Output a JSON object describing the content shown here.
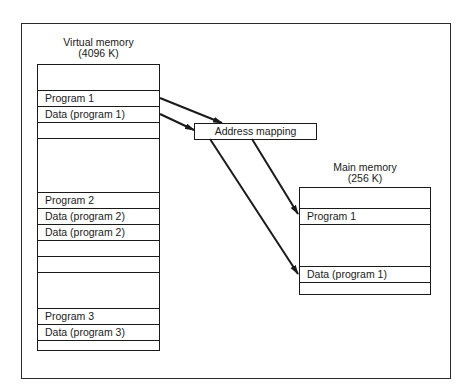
{
  "diagram": {
    "virtual_memory": {
      "title": "Virtual memory",
      "size": "(4096 K)",
      "rows": [
        {
          "label": "",
          "top": 0,
          "height": 26
        },
        {
          "label": "Program 1",
          "top": 26,
          "height": 16
        },
        {
          "label": "Data (program 1)",
          "top": 42,
          "height": 16
        },
        {
          "label": "",
          "top": 58,
          "height": 16
        },
        {
          "label": "",
          "top": 74,
          "height": 54
        },
        {
          "label": "Program 2",
          "top": 128,
          "height": 16
        },
        {
          "label": "Data (program 2)",
          "top": 144,
          "height": 16
        },
        {
          "label": "Data (program 2)",
          "top": 160,
          "height": 16
        },
        {
          "label": "",
          "top": 176,
          "height": 16
        },
        {
          "label": "",
          "top": 192,
          "height": 16
        },
        {
          "label": "",
          "top": 208,
          "height": 36
        },
        {
          "label": "Program 3",
          "top": 244,
          "height": 16
        },
        {
          "label": "Data (program 3)",
          "top": 260,
          "height": 16
        },
        {
          "label": "",
          "top": 276,
          "height": 11
        }
      ]
    },
    "address_mapping": {
      "label": "Address mapping"
    },
    "main_memory": {
      "title": "Main memory",
      "size": "(256 K)",
      "rows": [
        {
          "label": "",
          "top": 0,
          "height": 21
        },
        {
          "label": "Program 1",
          "top": 21,
          "height": 16
        },
        {
          "label": "",
          "top": 37,
          "height": 42
        },
        {
          "label": "Data (program 1)",
          "top": 79,
          "height": 16
        },
        {
          "label": "",
          "top": 95,
          "height": 13
        }
      ]
    },
    "arrows": [
      {
        "from": "virtual_memory.Program 1",
        "to": "address_mapping",
        "x1": 160,
        "y1": 98,
        "x2": 222,
        "y2": 123
      },
      {
        "from": "virtual_memory.Data (program 1)",
        "to": "address_mapping",
        "x1": 160,
        "y1": 114,
        "x2": 194,
        "y2": 130
      },
      {
        "from": "address_mapping",
        "to": "main_memory.Program 1",
        "x1": 252,
        "y1": 139,
        "x2": 298,
        "y2": 214
      },
      {
        "from": "address_mapping",
        "to": "main_memory.Data (program 1)",
        "x1": 210,
        "y1": 139,
        "x2": 298,
        "y2": 274
      }
    ],
    "colors": {
      "line": "#1a1a1a",
      "background": "#ffffff"
    }
  }
}
